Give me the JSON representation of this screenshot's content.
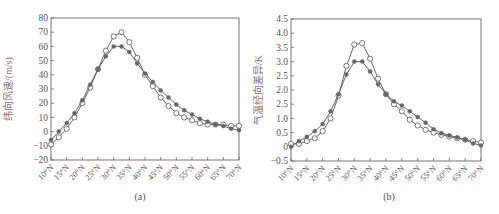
{
  "figure": {
    "panels": [
      {
        "id": "a",
        "caption": "(a)",
        "ylabel": "纬向风速/(m/s)",
        "ytick_labels": [
          "80",
          "70",
          "60",
          "50",
          "40",
          "30",
          "20",
          "10",
          "0",
          "−10",
          "−20"
        ],
        "xtick_labels": [
          "10°N",
          "15°N",
          "20°N",
          "25°N",
          "30°N",
          "35°N",
          "40°N",
          "45°N",
          "50°N",
          "55°N",
          "60°N",
          "65°N",
          "70°N"
        ]
      },
      {
        "id": "b",
        "caption": "(b)",
        "ylabel": "气温经向差异/K",
        "ytick_labels": [
          "4.5",
          "4.0",
          "3.5",
          "3.0",
          "2.5",
          "2.0",
          "2.5",
          "1.0",
          "0.5",
          "0",
          "−0.5"
        ],
        "xtick_labels": [
          "10°N",
          "15°N",
          "20°N",
          "25°N",
          "30°N",
          "35°N",
          "40°N",
          "45°N",
          "50°N",
          "55°N",
          "60°N",
          "65°N",
          "70°N"
        ]
      }
    ],
    "colors": {
      "line": "#555555",
      "marker_open_fill": "#ffffff",
      "marker_filled": "#666666",
      "axis": "#666666",
      "text": "#555555",
      "ylabel": "#8a7070"
    }
  },
  "chart_data": [
    {
      "type": "line",
      "title": "(a)",
      "xlabel": "",
      "ylabel": "纬向风速/(m/s)",
      "x": [
        10,
        12.5,
        15,
        17.5,
        20,
        22.5,
        25,
        27.5,
        30,
        32.5,
        35,
        37.5,
        40,
        42.5,
        45,
        47.5,
        50,
        52.5,
        55,
        57.5,
        60,
        62.5,
        65,
        67.5,
        70
      ],
      "xlim": [
        10,
        70
      ],
      "ylim": [
        -20,
        80
      ],
      "yticks": [
        -20,
        -10,
        0,
        10,
        20,
        30,
        40,
        50,
        60,
        70,
        80
      ],
      "xticks": [
        "10°N",
        "15°N",
        "20°N",
        "25°N",
        "30°N",
        "35°N",
        "40°N",
        "45°N",
        "50°N",
        "55°N",
        "60°N",
        "65°N",
        "70°N"
      ],
      "grid": false,
      "legend": "none",
      "series": [
        {
          "name": "open-circle",
          "marker": "open-circle",
          "values": [
            -9,
            -4,
            2,
            10,
            20,
            31,
            44,
            57,
            67,
            70,
            63,
            52,
            40,
            32,
            24,
            18,
            13,
            10,
            8,
            6,
            5,
            5,
            5,
            4,
            4
          ]
        },
        {
          "name": "filled-circle",
          "marker": "filled-circle",
          "values": [
            -6,
            0,
            6,
            13,
            22,
            33,
            44,
            53,
            60,
            60,
            56,
            48,
            41,
            35,
            29,
            24,
            19,
            15,
            12,
            9,
            7,
            5,
            4,
            2,
            1
          ]
        }
      ]
    },
    {
      "type": "line",
      "title": "(b)",
      "xlabel": "",
      "ylabel": "气温经向差异/K",
      "x": [
        10,
        12.5,
        15,
        17.5,
        20,
        22.5,
        25,
        27.5,
        30,
        32.5,
        35,
        37.5,
        40,
        42.5,
        45,
        47.5,
        50,
        52.5,
        55,
        57.5,
        60,
        62.5,
        65,
        67.5,
        70
      ],
      "xlim": [
        10,
        70
      ],
      "ylim": [
        -0.5,
        4.5
      ],
      "yticks": [
        -0.5,
        0,
        0.5,
        1.0,
        1.5,
        2.0,
        2.5,
        3.0,
        3.5,
        4.0,
        4.5
      ],
      "xticks": [
        "10°N",
        "15°N",
        "20°N",
        "25°N",
        "30°N",
        "35°N",
        "40°N",
        "45°N",
        "50°N",
        "55°N",
        "60°N",
        "65°N",
        "70°N"
      ],
      "grid": false,
      "legend": "none",
      "series": [
        {
          "name": "open-circle",
          "marker": "open-circle",
          "values": [
            0.1,
            0.1,
            0.2,
            0.3,
            0.55,
            1.0,
            1.8,
            2.85,
            3.6,
            3.65,
            3.1,
            2.4,
            1.85,
            1.5,
            1.25,
            0.95,
            0.75,
            0.6,
            0.5,
            0.42,
            0.36,
            0.3,
            0.25,
            0.2,
            0.15
          ]
        },
        {
          "name": "filled-circle",
          "marker": "filled-circle",
          "values": [
            0,
            0.2,
            0.35,
            0.55,
            0.8,
            1.25,
            1.85,
            2.55,
            3.0,
            3.0,
            2.65,
            2.2,
            1.85,
            1.6,
            1.45,
            1.25,
            1.05,
            0.85,
            0.62,
            0.48,
            0.4,
            0.33,
            0.25,
            0.12,
            0.05
          ]
        }
      ]
    }
  ]
}
